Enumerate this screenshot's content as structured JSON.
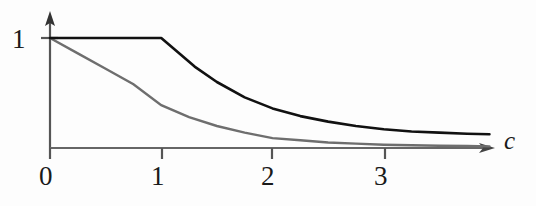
{
  "figure": {
    "background_color": "#fdfdfd",
    "ink_color": "#1a1a1a",
    "secondary_ink_color": "#6e6e6e"
  },
  "labels": {
    "y_tick_1": "1",
    "x_tick_0": "0",
    "x_tick_1": "1",
    "x_tick_2": "2",
    "x_tick_3": "3",
    "x_axis_title": "c"
  },
  "chart_data": {
    "type": "line",
    "title": "",
    "xlabel": "c",
    "ylabel": "",
    "xlim": [
      0,
      4
    ],
    "ylim": [
      0,
      1.15
    ],
    "grid": false,
    "legend": null,
    "axis_style": {
      "x_axis_arrow": true,
      "y_axis_arrow": true,
      "x_ticks": [
        0,
        1,
        2,
        3
      ],
      "x_tick_labels": [
        "0",
        "1",
        "2",
        "3"
      ],
      "y_ticks": [
        1
      ],
      "y_tick_labels": [
        "1"
      ]
    },
    "series": [
      {
        "name": "upper-curve",
        "color": "#111111",
        "line_width": 2.6,
        "description": "flat at 1 until c=1 then decays toward 0",
        "x": [
          0,
          0.25,
          0.5,
          0.75,
          1.0,
          1.15,
          1.3,
          1.5,
          1.75,
          2.0,
          2.25,
          2.5,
          2.75,
          3.0,
          3.25,
          3.5,
          3.75,
          3.95
        ],
        "y": [
          1.0,
          1.0,
          1.0,
          1.0,
          1.0,
          0.87,
          0.74,
          0.6,
          0.46,
          0.36,
          0.29,
          0.24,
          0.2,
          0.17,
          0.15,
          0.14,
          0.13,
          0.125
        ]
      },
      {
        "name": "lower-curve",
        "color": "#6e6e6e",
        "line_width": 2.4,
        "description": "decays from 1 at c=0 toward 0",
        "x": [
          0,
          0.25,
          0.5,
          0.75,
          1.0,
          1.25,
          1.5,
          1.75,
          2.0,
          2.25,
          2.5,
          2.75,
          3.0,
          3.25,
          3.5,
          3.75,
          3.95
        ],
        "y": [
          1.0,
          0.86,
          0.72,
          0.58,
          0.39,
          0.28,
          0.2,
          0.14,
          0.09,
          0.07,
          0.05,
          0.04,
          0.03,
          0.025,
          0.02,
          0.018,
          0.015
        ]
      }
    ]
  }
}
